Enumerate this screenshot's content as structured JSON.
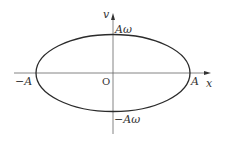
{
  "diagram": {
    "type": "phase-space ellipse",
    "axes": {
      "x_label": "x",
      "y_label": "v",
      "origin_label": "O"
    },
    "ellipse": {
      "x_intercepts": [
        "-A",
        "A"
      ],
      "y_intercepts": [
        "Aω",
        "-Aω"
      ]
    },
    "labels": {
      "v": "v",
      "x": "x",
      "origin": "O",
      "pos_A": "A",
      "neg_A": "−A",
      "pos_Aw": "Aω",
      "neg_Aw": "−Aω"
    },
    "colors": {
      "stroke": "#2b2b2b",
      "axis": "#555555",
      "text": "#333333",
      "background": "#ffffff"
    }
  }
}
